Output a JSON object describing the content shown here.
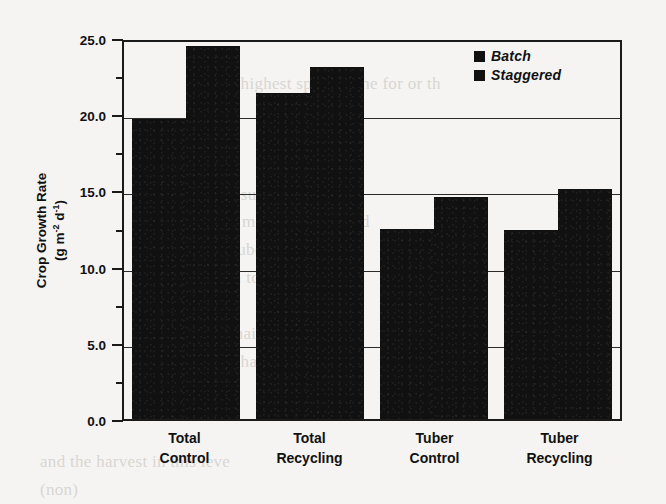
{
  "chart_data": {
    "type": "bar",
    "title": "",
    "xlabel": "",
    "ylabel": "Crop Growth Rate (g m-2 d-1)",
    "ylabel_line1": "Crop Growth Rate",
    "ylabel_line2_prefix": "(g m",
    "ylabel_line2_sup1": "-2",
    "ylabel_line2_mid": " d",
    "ylabel_line2_sup2": "-1",
    "ylabel_line2_suffix": ")",
    "categories": [
      "Total Control",
      "Total Recycling",
      "Tuber Control",
      "Tuber Recycling"
    ],
    "category_lines": [
      [
        "Total",
        "Control"
      ],
      [
        "Total",
        "Recycling"
      ],
      [
        "Tuber",
        "Control"
      ],
      [
        "Tuber",
        "Recycling"
      ]
    ],
    "series": [
      {
        "name": "Batch",
        "values": [
          19.7,
          21.4,
          12.5,
          12.4
        ],
        "color": "#111111"
      },
      {
        "name": "Staggered",
        "values": [
          24.5,
          23.1,
          14.6,
          15.1
        ],
        "color": "#111111"
      }
    ],
    "ylim": [
      0.0,
      25.0
    ],
    "ytick_values": [
      0.0,
      5.0,
      10.0,
      15.0,
      20.0,
      25.0
    ],
    "ytick_labels": [
      "0.0",
      "5.0",
      "10.0",
      "15.0",
      "20.0",
      "25.0"
    ],
    "yminor_tick_values": [
      2.5,
      7.5,
      12.5,
      17.5,
      22.5
    ],
    "gridline_values": [
      5.0,
      10.0,
      15.0,
      20.0
    ],
    "grid": true,
    "legend_position": "top-right"
  },
  "legend": {
    "entries": [
      {
        "label": "Batch"
      },
      {
        "label": "Staggered"
      }
    ]
  },
  "background_text": [
    "in the highest  specific  the   for or th",
    "in   a superior one sys",
    "(0.8 g m-2 d-1)  for  yield",
    "the      tuber    continuous",
    "tion     to      growth",
    "r  and   pr",
    "and   mainly   fluctuation",
    "to  the  harvest  this   time",
    "and   the   harvest  in  this  leve",
    "(non)"
  ]
}
